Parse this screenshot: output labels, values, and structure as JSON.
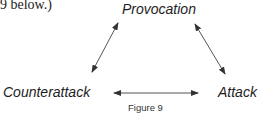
{
  "preceding_text": "9 below.)",
  "diagram": {
    "nodes": {
      "top": "Provocation",
      "bottom_left": "Counterattack",
      "bottom_right": "Attack"
    },
    "edges": [
      {
        "from": "Provocation",
        "to": "Counterattack",
        "type": "bidirectional"
      },
      {
        "from": "Provocation",
        "to": "Attack",
        "type": "bidirectional"
      },
      {
        "from": "Counterattack",
        "to": "Attack",
        "type": "bidirectional"
      }
    ],
    "line_color": "#555555"
  },
  "caption": "Figure 9"
}
